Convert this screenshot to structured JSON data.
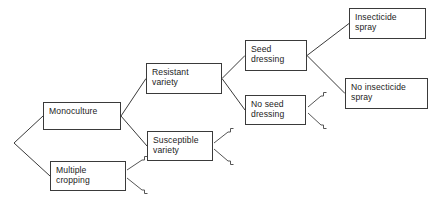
{
  "diagram": {
    "type": "decision-tree",
    "title": "",
    "colors": {
      "background": "#ffffff",
      "line": "#3a3a3a",
      "box_border": "#3a3a3a",
      "text": "#1c1c1c"
    },
    "nodes": [
      {
        "id": "root",
        "label": "",
        "x": 14,
        "y": 143,
        "w": 0,
        "h": 0,
        "box": false
      },
      {
        "id": "monoculture",
        "label": "Monoculture",
        "x": 43,
        "y": 102,
        "w": 78,
        "h": 28,
        "box": true
      },
      {
        "id": "multiple-cropping",
        "label": "Multiple\ncropping",
        "x": 50,
        "y": 161,
        "w": 76,
        "h": 30,
        "box": true
      },
      {
        "id": "resistant-variety",
        "label": "Resistant\nvariety",
        "x": 146,
        "y": 63,
        "w": 76,
        "h": 31,
        "box": true
      },
      {
        "id": "susceptible-variety",
        "label": "Susceptible\nvariety",
        "x": 147,
        "y": 131,
        "w": 66,
        "h": 30,
        "box": true
      },
      {
        "id": "seed-dressing",
        "label": "Seed\ndressing",
        "x": 245,
        "y": 40,
        "w": 62,
        "h": 31,
        "box": true
      },
      {
        "id": "no-seed-dressing",
        "label": "No seed\ndressing",
        "x": 245,
        "y": 95,
        "w": 61,
        "h": 30,
        "box": true
      },
      {
        "id": "insecticide-spray",
        "label": "Insecticide\nspray",
        "x": 349,
        "y": 8,
        "w": 77,
        "h": 31,
        "box": true
      },
      {
        "id": "no-insecticide-spray",
        "label": "No insecticide\nspray",
        "x": 345,
        "y": 78,
        "w": 83,
        "h": 31,
        "box": true
      }
    ],
    "edges": [
      {
        "from": "root",
        "to": "monoculture"
      },
      {
        "from": "root",
        "to": "multiple-cropping"
      },
      {
        "from": "monoculture",
        "to": "resistant-variety"
      },
      {
        "from": "monoculture",
        "to": "susceptible-variety"
      },
      {
        "from": "resistant-variety",
        "to": "seed-dressing"
      },
      {
        "from": "resistant-variety",
        "to": "no-seed-dressing"
      },
      {
        "from": "seed-dressing",
        "to": "insecticide-spray"
      },
      {
        "from": "seed-dressing",
        "to": "no-insecticide-spray"
      }
    ],
    "truncated_branches": [
      {
        "from": "multiple-cropping",
        "direction": "up",
        "anchor_x": 127,
        "anchor_y": 170,
        "end_x": 142,
        "end_y": 160
      },
      {
        "from": "multiple-cropping",
        "direction": "down",
        "anchor_x": 127,
        "anchor_y": 178,
        "end_x": 142,
        "end_y": 190
      },
      {
        "from": "susceptible-variety",
        "direction": "up",
        "anchor_x": 214,
        "anchor_y": 143,
        "end_x": 228,
        "end_y": 132
      },
      {
        "from": "susceptible-variety",
        "direction": "down",
        "anchor_x": 214,
        "anchor_y": 149,
        "end_x": 228,
        "end_y": 161
      },
      {
        "from": "no-seed-dressing",
        "direction": "up",
        "anchor_x": 308,
        "anchor_y": 107,
        "end_x": 321,
        "end_y": 96
      },
      {
        "from": "no-seed-dressing",
        "direction": "down",
        "anchor_x": 308,
        "anchor_y": 113,
        "end_x": 321,
        "end_y": 125
      }
    ]
  }
}
